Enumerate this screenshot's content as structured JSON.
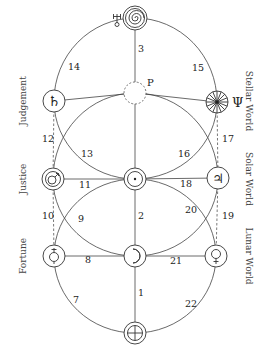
{
  "diagram": {
    "type": "kabbalistic tree of life with planetary correspondences",
    "labels_left": [
      {
        "id": "judgement",
        "text": "Judgement"
      },
      {
        "id": "justice",
        "text": "Justice"
      },
      {
        "id": "fortune",
        "text": "Fortune"
      }
    ],
    "labels_right": [
      {
        "id": "stellar",
        "text": "Stellar World"
      },
      {
        "id": "solar",
        "text": "Solar World"
      },
      {
        "id": "lunar",
        "text": "Lunar World"
      }
    ],
    "nodes": [
      {
        "id": "top",
        "glyph": "spiral",
        "symbol_name": "uranus-spiral",
        "side_glyph": "♅"
      },
      {
        "id": "pluto",
        "glyph": "dashed-circle",
        "side_glyph": "P"
      },
      {
        "id": "saturn",
        "glyph": "♄"
      },
      {
        "id": "neptune",
        "glyph": "wheel",
        "side_glyph": "Ψ"
      },
      {
        "id": "mars",
        "glyph": "♂"
      },
      {
        "id": "sun",
        "glyph": "☉"
      },
      {
        "id": "jupiter",
        "glyph": "♃"
      },
      {
        "id": "venus-left",
        "glyph": "♀ (inverted)"
      },
      {
        "id": "moon",
        "glyph": "☽"
      },
      {
        "id": "venus-right",
        "glyph": "♀"
      },
      {
        "id": "earth",
        "glyph": "⊕"
      }
    ],
    "paths": [
      {
        "n": "1",
        "from": "earth",
        "to": "moon"
      },
      {
        "n": "2",
        "from": "moon",
        "to": "sun"
      },
      {
        "n": "3",
        "from": "sun",
        "to": "top"
      },
      {
        "n": "7",
        "from": "venus-left",
        "to": "earth"
      },
      {
        "n": "8",
        "from": "venus-left",
        "to": "moon"
      },
      {
        "n": "9",
        "from": "sun",
        "to": "venus-left"
      },
      {
        "n": "10",
        "from": "venus-left",
        "to": "mars"
      },
      {
        "n": "11",
        "from": "mars",
        "to": "sun"
      },
      {
        "n": "12",
        "from": "mars",
        "to": "saturn"
      },
      {
        "n": "13",
        "from": "saturn",
        "to": "sun"
      },
      {
        "n": "14",
        "from": "saturn",
        "to": "top"
      },
      {
        "n": "15",
        "from": "top",
        "to": "neptune"
      },
      {
        "n": "16",
        "from": "neptune",
        "to": "sun"
      },
      {
        "n": "17",
        "from": "neptune",
        "to": "jupiter"
      },
      {
        "n": "18",
        "from": "sun",
        "to": "jupiter"
      },
      {
        "n": "19",
        "from": "jupiter",
        "to": "venus-right"
      },
      {
        "n": "20",
        "from": "sun",
        "to": "venus-right"
      },
      {
        "n": "21",
        "from": "moon",
        "to": "venus-right"
      },
      {
        "n": "22",
        "from": "venus-right",
        "to": "earth"
      }
    ],
    "side_symbols": {
      "uranus": "♅",
      "pluto": "P",
      "neptune": "Ψ"
    }
  }
}
